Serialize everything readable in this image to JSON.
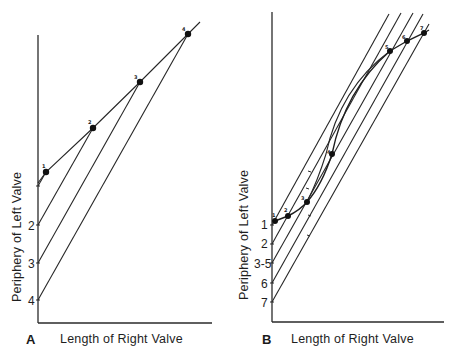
{
  "figure": {
    "panels": [
      {
        "id": "A",
        "letter": "A",
        "xlabel": "Length of Right Valve",
        "ylabel": "Periphery of Left Valve",
        "y_tick_labels": [
          "1",
          "2",
          "3",
          "4"
        ],
        "point_labels": [
          "1",
          "2",
          "3",
          "4"
        ]
      },
      {
        "id": "B",
        "letter": "B",
        "xlabel": "Length of Right Valve",
        "ylabel": "Periphery of Left Valve",
        "y_tick_labels": [
          "1",
          "2",
          "3-5",
          "6",
          "7"
        ],
        "point_labels": [
          "1",
          "2",
          "3",
          "4",
          "5",
          "6",
          "7"
        ]
      }
    ]
  },
  "panelA": {
    "letter": "A",
    "xlabel": "Length of Right Valve",
    "ylabel": "Periphery of Left Valve",
    "ticks": {
      "t1": "1",
      "t2": "2",
      "t3": "3",
      "t4": "4"
    },
    "points": {
      "p1": "1",
      "p2": "2",
      "p3": "3",
      "p4": "4"
    }
  },
  "panelB": {
    "letter": "B",
    "xlabel": "Length of Right Valve",
    "ylabel": "Periphery of Left Valve",
    "ticks": {
      "t1": "1",
      "t2": "2",
      "t3": "3-5",
      "t6": "6",
      "t7": "7"
    },
    "points": {
      "p1": "1",
      "p2": "2",
      "p3": "3",
      "p4": "4",
      "p5": "5",
      "p6": "6",
      "p7": "7"
    }
  }
}
